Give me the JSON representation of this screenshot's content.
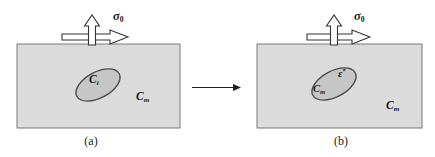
{
  "figure": {
    "colors": {
      "background": "#ffffff",
      "matrix_fill": "#dbdbdb",
      "matrix_stroke": "#7a7a7a",
      "inclusion_fill": "#c6c6c6",
      "inclusion_stroke": "#4a4a4a",
      "arrow_fill": "#ffffff",
      "arrow_stroke": "#333333",
      "transform_arrow_color": "#222222"
    }
  },
  "panel_a": {
    "caption": "(a)",
    "stress_label": {
      "symbol": "σ",
      "subscript": "0"
    },
    "inclusion_label": {
      "symbol": "C",
      "subscript": "i"
    },
    "matrix_label": {
      "symbol": "C",
      "subscript": "m"
    }
  },
  "panel_b": {
    "caption": "(b)",
    "stress_label": {
      "symbol": "σ",
      "subscript": "0"
    },
    "inclusion_label": {
      "symbol": "C",
      "subscript": "m"
    },
    "eigenstrain_label": {
      "symbol": "ε",
      "superscript": "*"
    },
    "matrix_label": {
      "symbol": "C",
      "subscript": "m"
    }
  }
}
